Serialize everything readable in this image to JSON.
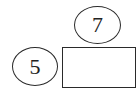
{
  "diagram": {
    "nodes": [
      {
        "id": "top-circle",
        "shape": "ellipse",
        "label": "7"
      },
      {
        "id": "left-circle",
        "shape": "ellipse",
        "label": "5"
      },
      {
        "id": "answer-box",
        "shape": "rectangle",
        "label": ""
      }
    ],
    "colors": {
      "stroke": "#2a2a2a",
      "background": "#ffffff",
      "text": "#222222"
    }
  }
}
